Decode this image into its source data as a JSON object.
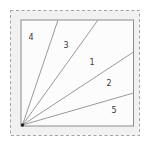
{
  "figure": {
    "colors": {
      "page_bg": "#ffffff",
      "mat_bg": "#f1f1f1",
      "square_bg": "#fcfcfc",
      "dashed_border": "#a3a3a3",
      "square_border": "#8c8c8c",
      "ray": "#9a9a9a",
      "label": "#3a3a3a",
      "origin_dot": "#222222"
    },
    "dashed_border": {
      "x": 10.5,
      "y": 10.5,
      "width": 129,
      "height": 125,
      "dash": "3,2.5"
    },
    "square": {
      "x": 21,
      "y": 20,
      "width": 112.5,
      "height": 106
    },
    "origin": {
      "x": 22.5,
      "y": 125,
      "dot_radius": 1.7
    },
    "rays": [
      {
        "name": "ray-between-4-3",
        "x2": 58,
        "y2": 20
      },
      {
        "name": "ray-between-3-1",
        "x2": 98,
        "y2": 20
      },
      {
        "name": "ray-between-1-2",
        "x2": 133.5,
        "y2": 52
      },
      {
        "name": "ray-between-2-5",
        "x2": 133.5,
        "y2": 93
      }
    ],
    "regions": [
      {
        "label": "4",
        "x": 31,
        "y": 37
      },
      {
        "label": "3",
        "x": 66,
        "y": 45
      },
      {
        "label": "1",
        "x": 92,
        "y": 62
      },
      {
        "label": "2",
        "x": 109,
        "y": 83
      },
      {
        "label": "5",
        "x": 114,
        "y": 110
      }
    ]
  }
}
